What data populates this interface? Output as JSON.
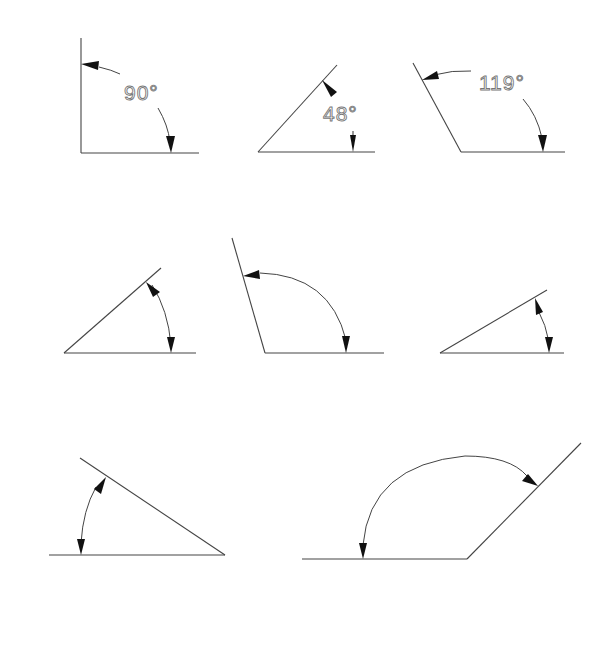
{
  "diagram": {
    "figures": [
      {
        "id": 1,
        "label": "90°",
        "type": "right-angle"
      },
      {
        "id": 2,
        "label": "48°",
        "type": "acute-angle"
      },
      {
        "id": 3,
        "label": "119°",
        "type": "obtuse-angle"
      },
      {
        "id": 4,
        "label": "",
        "type": "acute-angle"
      },
      {
        "id": 5,
        "label": "",
        "type": "obtuse-angle"
      },
      {
        "id": 6,
        "label": "",
        "type": "acute-angle"
      },
      {
        "id": 7,
        "label": "",
        "type": "acute-angle"
      },
      {
        "id": 8,
        "label": "",
        "type": "obtuse-angle"
      }
    ],
    "colors": {
      "line": "#444444",
      "arrowhead": "#111111",
      "label": "#777777",
      "background": "#ffffff"
    }
  }
}
